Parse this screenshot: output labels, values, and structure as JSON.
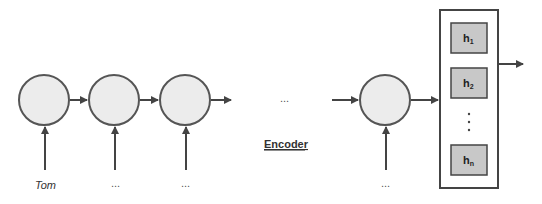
{
  "diagram": {
    "title": "Encoder",
    "inputs": [
      "Tom",
      "...",
      "...",
      "..."
    ],
    "middle_ellipsis": "...",
    "hidden_states": [
      {
        "label": "h",
        "sub": "1"
      },
      {
        "label": "h",
        "sub": "2"
      },
      {
        "label": "h",
        "sub": "n"
      }
    ],
    "vertical_ellipsis": "⋮"
  }
}
